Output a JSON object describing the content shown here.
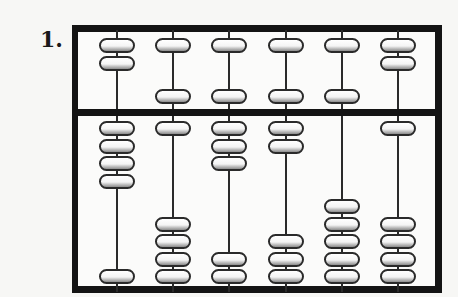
{
  "problem": {
    "number_label": "1."
  },
  "abacus": {
    "frame_color": "#141414",
    "bead_fill": "#ffffff",
    "rod_count": 6,
    "rods": [
      {
        "index": 1,
        "upper_top": 2,
        "upper_bottom": 0,
        "lower_top": 4,
        "lower_bottom": 1
      },
      {
        "index": 2,
        "upper_top": 1,
        "upper_bottom": 1,
        "lower_top": 1,
        "lower_bottom": 4
      },
      {
        "index": 3,
        "upper_top": 1,
        "upper_bottom": 1,
        "lower_top": 3,
        "lower_bottom": 2
      },
      {
        "index": 4,
        "upper_top": 1,
        "upper_bottom": 1,
        "lower_top": 2,
        "lower_bottom": 3
      },
      {
        "index": 5,
        "upper_top": 1,
        "upper_bottom": 1,
        "lower_top": 0,
        "lower_bottom": 5
      },
      {
        "index": 6,
        "upper_top": 2,
        "upper_bottom": 0,
        "lower_top": 1,
        "lower_bottom": 4
      }
    ]
  }
}
